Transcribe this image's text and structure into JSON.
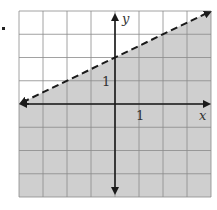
{
  "chart_data": {
    "type": "line",
    "title": "",
    "xlabel": "x",
    "ylabel": "y",
    "xlim": [
      -4,
      4
    ],
    "ylim": [
      -4,
      4
    ],
    "grid": true,
    "tick_labels": {
      "x": [
        "1"
      ],
      "y": [
        "1"
      ]
    },
    "boundary_line": {
      "equation": "y = 0.5x + 2",
      "style": "dashed",
      "slope": 0.5,
      "intercept": 2,
      "points": [
        [
          -4,
          0
        ],
        [
          4,
          4
        ]
      ]
    },
    "shaded_region": "below boundary line (y < 0.5x + 2)",
    "colors": {
      "shade": "#cfcfcf",
      "grid": "#8a8a8a",
      "axis": "#1a1a1a",
      "background": "#ffffff"
    }
  },
  "labels": {
    "x_axis": "x",
    "y_axis": "y",
    "x_tick": "1",
    "y_tick": "1"
  }
}
